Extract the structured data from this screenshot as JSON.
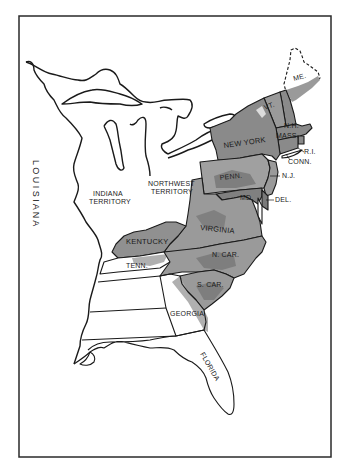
{
  "map": {
    "title": "United States territories and states (c. 1800)",
    "colors": {
      "background": "#ffffff",
      "border": "#2a2a2a",
      "land_unsettled": "#ffffff",
      "shade_dark": "#7a7a7a",
      "shade_mid": "#9a9a9a",
      "shade_light": "#bdbdbd",
      "line": "#1a1a1a"
    },
    "regions": {
      "louisiana": "L O U I S I A N A",
      "indiana_territory_1": "INDIANA",
      "indiana_territory_2": "TERRITORY",
      "northwest_territory_1": "NORTHWEST",
      "northwest_territory_2": "TERRITORY",
      "maine": "ME.",
      "vermont": "VT.",
      "new_hampshire": "N.H.",
      "massachusetts": "MASS.",
      "rhode_island": "R.I.",
      "connecticut": "CONN.",
      "new_york": "NEW YORK",
      "pennsylvania": "PENN.",
      "new_jersey": "N.J.",
      "maryland": "MD.",
      "delaware": "DEL.",
      "virginia": "VIRGINIA",
      "kentucky": "KENTUCKY",
      "tennessee": "TENN.",
      "north_carolina": "N. CAR.",
      "south_carolina": "S. CAR.",
      "georgia": "GEORGIA",
      "florida": "FLORIDA"
    }
  }
}
